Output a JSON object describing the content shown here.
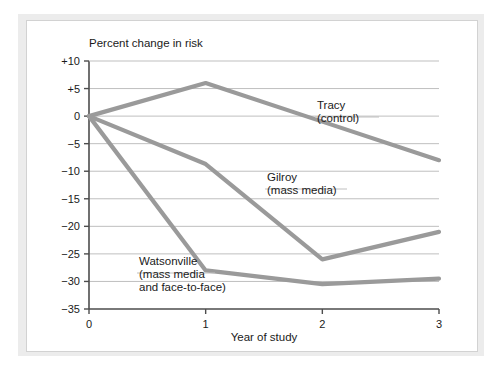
{
  "chart_data": {
    "type": "line",
    "title": "",
    "ylabel": "Percent change in risk",
    "xlabel": "Year of study",
    "x": [
      0,
      1,
      2,
      3
    ],
    "xticklabels": [
      "0",
      "1",
      "2",
      "3"
    ],
    "yticks": [
      10,
      5,
      0,
      -5,
      -10,
      -15,
      -20,
      -25,
      -30,
      -35
    ],
    "yticklabels": [
      "+10",
      "+5",
      "0",
      "−5",
      "−10",
      "−15",
      "−20",
      "−25",
      "−30",
      "−35"
    ],
    "xlim": [
      0,
      3
    ],
    "ylim": [
      -35,
      10
    ],
    "grid": true,
    "grid_axis": "y",
    "legend": "inline-annotations",
    "line_color": "#9a9a9a",
    "grid_color": "#bfbfbf",
    "axis_color": "#4d4d4d",
    "series": [
      {
        "name": "Tracy (control)",
        "label_line1": "Tracy",
        "label_line2": "(control)",
        "values": [
          0,
          6,
          -1,
          -8
        ]
      },
      {
        "name": "Gilroy (mass media)",
        "label_line1": "Gilroy",
        "label_line2": "(mass media)",
        "values": [
          0,
          -8.7,
          -26,
          -21
        ]
      },
      {
        "name": "Watsonville (mass media and face-to-face)",
        "label_line1": "Watsonville",
        "label_line2": "(mass media",
        "label_line3": "and face-to-face)",
        "values": [
          0,
          -28,
          -30.5,
          -29.5
        ]
      }
    ]
  }
}
